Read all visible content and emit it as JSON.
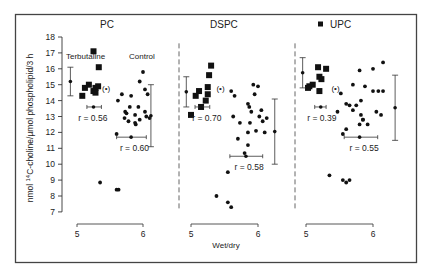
{
  "chart_data": {
    "type": "scatter",
    "title": "",
    "ylabel": "nmol 14C-choline/µmol phospholipid/3 h",
    "xlabel": "Wet/dry",
    "ylim": [
      7,
      18
    ],
    "yticks": [
      7,
      8,
      9,
      10,
      11,
      12,
      13,
      14,
      15,
      16,
      17,
      18
    ],
    "grid": false,
    "panels": [
      {
        "name": "PC",
        "xticks": [
          5,
          6
        ],
        "xpx": [
          77,
          143
        ],
        "labels": {
          "terbutaline": "Terbutaline",
          "control": "Control",
          "outlier": "(•)"
        },
        "series": [
          {
            "name": "Terbutaline",
            "marker": "square",
            "r": "r = 0.56",
            "points": [
              [
                5.08,
                14.3
              ],
              [
                5.12,
                14.8
              ],
              [
                5.18,
                15.0
              ],
              [
                5.25,
                14.6
              ],
              [
                5.28,
                14.8
              ],
              [
                5.28,
                14.5
              ],
              [
                5.32,
                14.9
              ],
              [
                5.25,
                17.1
              ],
              [
                5.33,
                16.1
              ]
            ],
            "mean": [
              5.25,
              14.7
            ],
            "x_err": [
              5.15,
              5.37
            ],
            "y_err": [
              14.3,
              16.1
            ]
          },
          {
            "name": "Control",
            "marker": "dot",
            "r": "r = 0.60",
            "points": [
              [
                5.68,
                14.4
              ],
              [
                5.62,
                14.0
              ],
              [
                5.8,
                13.6
              ],
              [
                5.82,
                14.3
              ],
              [
                5.95,
                15.2
              ],
              [
                6.0,
                15.8
              ],
              [
                5.93,
                13.6
              ],
              [
                6.03,
                14.7
              ],
              [
                6.07,
                14.4
              ],
              [
                5.73,
                13.3
              ],
              [
                5.75,
                13.2
              ],
              [
                5.72,
                12.9
              ],
              [
                5.78,
                12.7
              ],
              [
                5.88,
                13.1
              ],
              [
                5.88,
                12.6
              ],
              [
                5.89,
                12.5
              ],
              [
                5.95,
                12.8
              ],
              [
                6.03,
                13.3
              ],
              [
                6.05,
                13.0
              ],
              [
                6.1,
                12.9
              ],
              [
                5.6,
                11.9
              ],
              [
                5.35,
                8.85
              ],
              [
                5.6,
                8.4
              ],
              [
                5.63,
                8.4
              ]
            ],
            "mean": [
              5.82,
              11.7
            ],
            "x_err": [
              5.6,
              6.05
            ],
            "y_err": [
              11.1,
              15.0
            ],
            "y_err_x": 6.12
          }
        ]
      },
      {
        "name": "DSPC",
        "xticks": [
          5,
          6
        ],
        "xpx": [
          191,
          258
        ],
        "labels": {
          "outlier": "(•)"
        },
        "series": [
          {
            "name": "Terbutaline",
            "marker": "square",
            "r": "r = 0.70",
            "points": [
              [
                5.07,
                14.3
              ],
              [
                5.12,
                14.6
              ],
              [
                5.15,
                13.6
              ],
              [
                5.25,
                14.4
              ],
              [
                5.25,
                14.85
              ],
              [
                5.27,
                15.6
              ],
              [
                5.3,
                16.2
              ],
              [
                5.22,
                14.0
              ],
              [
                5.0,
                13.1
              ]
            ],
            "mean": [
              5.15,
              12.6
            ],
            "x_err": [
              5.06,
              5.28
            ],
            "y_err": [
              13.6,
              15.5
            ],
            "y_err_x": 4.93
          },
          {
            "name": "Control",
            "marker": "dot",
            "r": "r = 0.58",
            "points": [
              [
                5.6,
                14.6
              ],
              [
                5.65,
                14.3
              ],
              [
                5.85,
                13.8
              ],
              [
                5.87,
                13.6
              ],
              [
                5.9,
                13.3
              ],
              [
                5.63,
                13.0
              ],
              [
                5.73,
                12.6
              ],
              [
                6.05,
                13.4
              ],
              [
                6.07,
                12.7
              ],
              [
                6.13,
                12.9
              ],
              [
                5.88,
                12.6
              ],
              [
                5.85,
                12.0
              ],
              [
                5.97,
                12.1
              ],
              [
                6.02,
                13.0
              ],
              [
                5.7,
                11.6
              ],
              [
                5.85,
                11.2
              ],
              [
                5.8,
                10.7
              ],
              [
                6.1,
                12.0
              ],
              [
                5.95,
                14.4
              ],
              [
                5.93,
                15.0
              ],
              [
                6.0,
                14.9
              ],
              [
                5.55,
                9.5
              ],
              [
                5.38,
                8.0
              ],
              [
                5.55,
                7.6
              ],
              [
                5.6,
                7.3
              ]
            ],
            "mean": [
              5.82,
              10.5
            ],
            "x_err": [
              5.58,
              6.07
            ],
            "y_err": [
              10.0,
              14.1
            ],
            "y_err_x": 6.25
          }
        ]
      },
      {
        "name": "UPC",
        "xticks": [
          5,
          6
        ],
        "xpx": [
          306,
          373
        ],
        "labels": {
          "outlier": "(•)",
          "title_marker": "■"
        },
        "series": [
          {
            "name": "Terbutaline",
            "marker": "square",
            "r": "r = 0.39",
            "points": [
              [
                5.05,
                14.9
              ],
              [
                5.1,
                15.0
              ],
              [
                5.18,
                16.1
              ],
              [
                5.3,
                16.0
              ],
              [
                5.2,
                15.5
              ],
              [
                5.23,
                15.35
              ],
              [
                5.2,
                14.6
              ],
              [
                5.03,
                14.8
              ]
            ],
            "mean": [
              5.22,
              13.6
            ],
            "x_err": [
              5.13,
              5.3
            ],
            "y_err": [
              14.8,
              16.7
            ],
            "y_err_x": 4.95
          },
          {
            "name": "Control",
            "marker": "dot",
            "r": "r = 0.55",
            "points": [
              [
                5.8,
                15.9
              ],
              [
                6.0,
                16.0
              ],
              [
                5.7,
                15.0
              ],
              [
                5.88,
                14.9
              ],
              [
                6.08,
                14.6
              ],
              [
                6.15,
                16.4
              ],
              [
                5.52,
                14.45
              ],
              [
                5.6,
                13.8
              ],
              [
                5.65,
                13.7
              ],
              [
                5.47,
                13.3
              ],
              [
                5.75,
                13.7
              ],
              [
                5.7,
                13.4
              ],
              [
                5.82,
                14.0
              ],
              [
                6.0,
                14.6
              ],
              [
                6.15,
                14.6
              ],
              [
                5.82,
                13.1
              ],
              [
                5.85,
                12.8
              ],
              [
                5.8,
                12.5
              ],
              [
                5.92,
                12.5
              ],
              [
                5.6,
                12.2
              ],
              [
                6.05,
                13.3
              ],
              [
                6.12,
                13.1
              ],
              [
                5.85,
                12.8
              ],
              [
                5.55,
                11.9
              ],
              [
                5.35,
                9.3
              ],
              [
                5.55,
                9.0
              ],
              [
                5.6,
                8.85
              ],
              [
                5.65,
                9.0
              ]
            ],
            "mean": [
              5.8,
              11.7
            ],
            "x_err": [
              5.57,
              6.07
            ],
            "y_err": [
              11.5,
              15.6
            ],
            "y_err_x": 6.33
          }
        ]
      }
    ]
  },
  "figure": {
    "panel_titles": [
      "PC",
      "DSPC",
      "UPC"
    ],
    "y_axis_label_prefix": "nmol ",
    "y_axis_label_sup": "14",
    "y_axis_label_suffix": "C-choline/µmol phospholipid/3 h",
    "x_axis_label": "Wet/dry",
    "legend_terbutaline": "Terbutaline",
    "legend_control": "Control"
  }
}
